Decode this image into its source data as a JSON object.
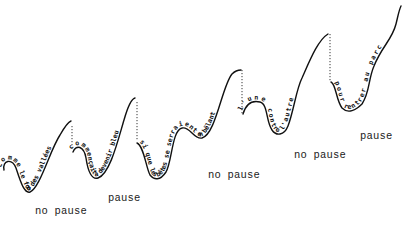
{
  "diagram": {
    "lines": [
      {
        "id": "line-1",
        "text": "comme le fond des vallées"
      },
      {
        "id": "line-2",
        "text": "commençait à devenir bleu"
      },
      {
        "id": "line-3",
        "text": "si que les bêtes se serraient en bêlant"
      },
      {
        "id": "line-4",
        "text": "l'une contre l'autre"
      },
      {
        "id": "line-5",
        "text": "pour rentrer au parc"
      }
    ],
    "labels": [
      {
        "id": "label-1",
        "text": "no pause"
      },
      {
        "id": "label-2",
        "text": "pause"
      },
      {
        "id": "label-3",
        "text": "no pause"
      },
      {
        "id": "label-4",
        "text": "no pause"
      },
      {
        "id": "label-5",
        "text": "pause"
      }
    ],
    "colors": {
      "ink": "#111111",
      "background": "#ffffff"
    }
  }
}
